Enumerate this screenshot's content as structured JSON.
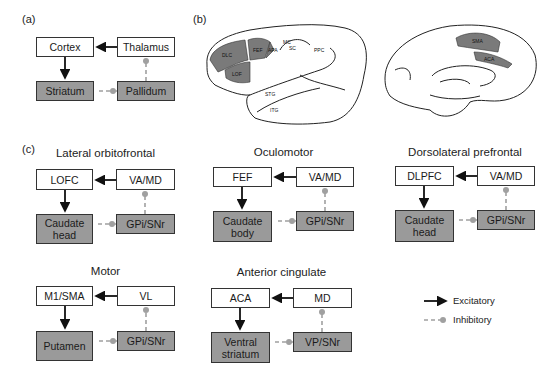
{
  "panels": {
    "a": {
      "label": "(a)",
      "boxes": {
        "cortex": "Cortex",
        "thalamus": "Thalamus",
        "striatum": "Striatum",
        "pallidum": "Pallidum"
      }
    },
    "b": {
      "label": "(b)",
      "brain_labels_lateral": [
        "DLC",
        "LOF",
        "FEF",
        "APA",
        "MC",
        "SC",
        "PPC",
        "STG",
        "ITG"
      ],
      "brain_labels_medial": [
        "SMA",
        "ACA"
      ]
    },
    "c": {
      "label": "(c)",
      "circuits": [
        {
          "title": "Lateral orbitofrontal",
          "cortex": "LOFC",
          "thalamus": "VA/MD",
          "striatum": "Caudate head",
          "pallidum": "GPi/SNr"
        },
        {
          "title": "Oculomotor",
          "cortex": "FEF",
          "thalamus": "VA/MD",
          "striatum": "Caudate body",
          "pallidum": "GPi/SNr"
        },
        {
          "title": "Dorsolateral prefrontal",
          "cortex": "DLPFC",
          "thalamus": "VA/MD",
          "striatum": "Caudate head",
          "pallidum": "GPi/SNr"
        },
        {
          "title": "Motor",
          "cortex": "M1/SMA",
          "thalamus": "VL",
          "striatum": "Putamen",
          "pallidum": "GPi/SNr"
        },
        {
          "title": "Anterior cingulate",
          "cortex": "ACA",
          "thalamus": "MD",
          "striatum": "Ventral striatum",
          "pallidum": "VP/SNr"
        }
      ]
    }
  },
  "legend": {
    "excitatory": "Excitatory",
    "inhibitory": "Inhibitory"
  },
  "colors": {
    "box_gray": "#9a9a9a",
    "excitatory": "#111111",
    "inhibitory": "#a0a0a0",
    "region_shade": "#7a7a7a"
  }
}
